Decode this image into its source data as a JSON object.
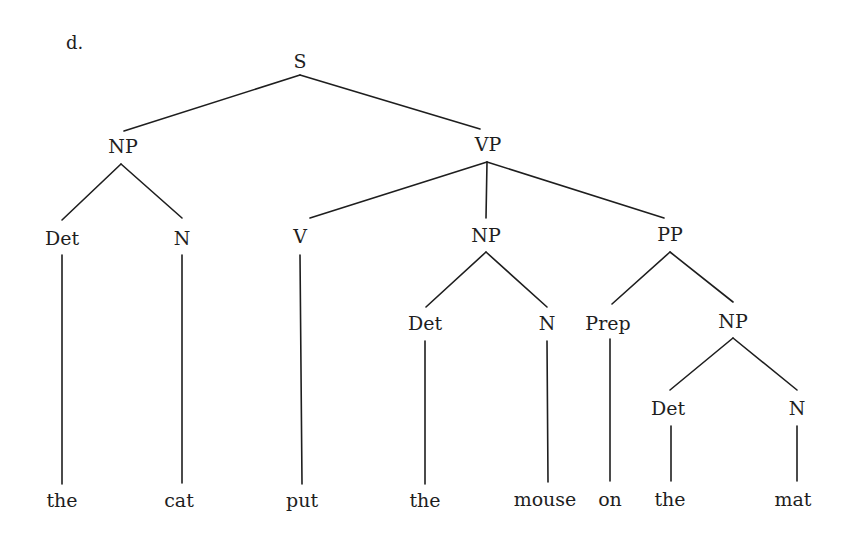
{
  "example_label": "d.",
  "tree": {
    "nodes": {
      "S": "S",
      "NP1": "NP",
      "VP": "VP",
      "Det1": "Det",
      "N1": "N",
      "V": "V",
      "NP2": "NP",
      "PP": "PP",
      "Det2": "Det",
      "N2": "N",
      "Prep": "Prep",
      "NP3": "NP",
      "Det3": "Det",
      "N3": "N"
    },
    "leaves": {
      "w1": "the",
      "w2": "cat",
      "w3": "put",
      "w4": "the",
      "w5": "mouse",
      "w6": "on",
      "w7": "the",
      "w8": "mat"
    },
    "structure": "[S [NP [Det the] [N cat]] [VP [V put] [NP [Det the] [N mouse]] [PP [Prep on] [NP [Det the] [N mat]]]]]"
  },
  "colors": {
    "ink": "#1e1e1e",
    "background": "#ffffff"
  }
}
